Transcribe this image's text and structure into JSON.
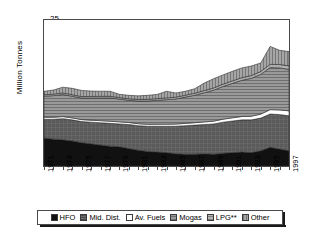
{
  "chart_data": {
    "type": "area",
    "stacked": true,
    "title": "",
    "subtitle": "",
    "xlabel": "",
    "ylabel": "Million Tonnes",
    "ylim": [
      0,
      25
    ],
    "yticks": [
      0,
      5,
      10,
      15,
      20,
      25
    ],
    "grid": false,
    "legend_position": "bottom",
    "x": [
      1971,
      1972,
      1973,
      1974,
      1975,
      1976,
      1977,
      1978,
      1979,
      1980,
      1981,
      1982,
      1983,
      1984,
      1985,
      1986,
      1987,
      1988,
      1989,
      1990,
      1991,
      1992,
      1993,
      1994,
      1995,
      1996,
      1997
    ],
    "xtick_labels": [
      "1971",
      "1973",
      "1975",
      "1977",
      "1979",
      "1981",
      "1983",
      "1985",
      "1987",
      "1989",
      "1991",
      "1993",
      "1995",
      "1997"
    ],
    "series": [
      {
        "name": "HFO",
        "color": "#111111",
        "pattern": "solid",
        "values": [
          4.8,
          4.6,
          4.5,
          4.3,
          4.0,
          3.8,
          3.6,
          3.4,
          3.3,
          3.0,
          2.7,
          2.5,
          2.4,
          2.3,
          2.1,
          2.0,
          2.0,
          2.1,
          2.0,
          2.2,
          2.3,
          2.4,
          2.3,
          2.6,
          3.2,
          2.9,
          2.6
        ]
      },
      {
        "name": "Mid. Dist.",
        "color": "#6e6e6e",
        "pattern": "cross-hatch",
        "values": [
          3.2,
          3.4,
          3.6,
          3.6,
          3.6,
          3.7,
          3.8,
          3.9,
          3.9,
          4.1,
          4.2,
          4.3,
          4.4,
          4.5,
          4.7,
          4.9,
          5.0,
          5.0,
          5.2,
          5.3,
          5.4,
          5.5,
          5.6,
          5.6,
          5.7,
          5.9,
          6.0
        ]
      },
      {
        "name": "Av. Fuels",
        "color": "#ffffff",
        "pattern": "solid",
        "values": [
          0.35,
          0.35,
          0.36,
          0.34,
          0.34,
          0.35,
          0.36,
          0.37,
          0.36,
          0.35,
          0.34,
          0.34,
          0.35,
          0.36,
          0.38,
          0.4,
          0.42,
          0.45,
          0.48,
          0.52,
          0.55,
          0.58,
          0.62,
          0.68,
          0.75,
          0.8,
          0.85
        ]
      },
      {
        "name": "Mogas",
        "color": "#8f8f8f",
        "pattern": "horizontal-lines",
        "values": [
          3.6,
          3.7,
          3.8,
          3.7,
          3.7,
          3.8,
          3.9,
          4.0,
          3.9,
          3.8,
          3.9,
          4.0,
          4.1,
          4.2,
          4.3,
          4.5,
          4.7,
          5.0,
          5.3,
          5.6,
          5.9,
          6.2,
          6.5,
          6.8,
          7.2,
          7.2,
          7.1
        ]
      },
      {
        "name": "LPG**",
        "color": "#a8a8a8",
        "pattern": "fine-dots",
        "values": [
          0.25,
          0.25,
          0.26,
          0.26,
          0.25,
          0.26,
          0.27,
          0.27,
          0.26,
          0.26,
          0.27,
          0.28,
          0.29,
          0.3,
          0.31,
          0.32,
          0.34,
          0.36,
          0.38,
          0.4,
          0.42,
          0.44,
          0.46,
          0.5,
          0.55,
          0.58,
          0.6
        ]
      },
      {
        "name": "Other",
        "color": "#999999",
        "pattern": "vertical-lines",
        "values": [
          0.6,
          0.7,
          0.98,
          1.1,
          1.05,
          0.92,
          0.88,
          0.86,
          0.55,
          0.59,
          0.6,
          0.68,
          0.72,
          1.14,
          0.71,
          0.68,
          0.77,
          1.29,
          1.59,
          1.58,
          1.65,
          1.68,
          1.64,
          1.46,
          3.08,
          2.43,
          2.45
        ]
      }
    ],
    "stack_totals": [
      12.8,
      13.0,
      13.5,
      13.3,
      12.9,
      12.8,
      12.8,
      12.8,
      11.8,
      12.1,
      12.0,
      12.1,
      12.3,
      12.8,
      12.5,
      12.8,
      13.2,
      14.2,
      14.9,
      15.6,
      16.2,
      16.8,
      17.1,
      17.6,
      20.5,
      19.8,
      19.6
    ]
  },
  "axes": {
    "y_title": "Million Tonnes",
    "y_ticks": [
      "25",
      "20",
      "15",
      "10",
      "5",
      "0"
    ],
    "x_ticks": [
      "1971",
      "1973",
      "1975",
      "1977",
      "1979",
      "1981",
      "1983",
      "1985",
      "1987",
      "1989",
      "1991",
      "1993",
      "1995",
      "1997"
    ]
  },
  "legend": {
    "items": [
      {
        "label": "HFO",
        "color": "#111111"
      },
      {
        "label": "Mid. Dist.",
        "color": "#6e6e6e"
      },
      {
        "label": "Av. Fuels",
        "color": "#ffffff"
      },
      {
        "label": "Mogas",
        "color": "#8f8f8f"
      },
      {
        "label": "LPG**",
        "color": "#a8a8a8"
      },
      {
        "label": "Other",
        "color": "#999999"
      }
    ]
  }
}
